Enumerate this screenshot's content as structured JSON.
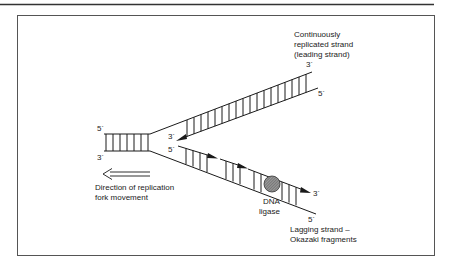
{
  "figure": {
    "type": "DNA replication fork diagram",
    "leading_strand_label": [
      "Continuously",
      "replicated strand",
      "(leading strand)"
    ],
    "lagging_strand_label": [
      "Lagging strand –",
      "Okazaki fragments"
    ],
    "direction_label": [
      "Direction of replication",
      "fork movement"
    ],
    "ligase_label": [
      "DNA",
      "ligase"
    ],
    "ends": {
      "parent_top": "5´",
      "parent_bottom": "3´",
      "upper_arm_outer": "3´",
      "upper_arm_inner_outer_end": "5´",
      "leading_new_3": "3´",
      "lagging_new_5": "5´",
      "lagging_new_3": "3´",
      "lower_arm_outer": "5´"
    },
    "colors": {
      "line": "#1a1a1a",
      "frame": "#555555",
      "ligase_fill": "#8a8a8a"
    }
  }
}
